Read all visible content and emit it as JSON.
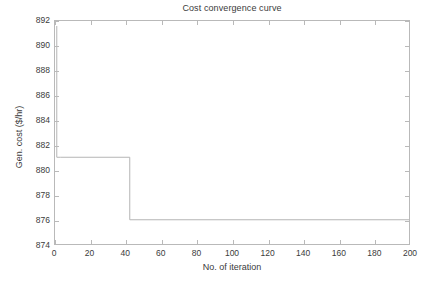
{
  "chart_data": {
    "type": "line",
    "title": "Cost convergence curve",
    "xlabel": "No. of iteration",
    "ylabel": "Gen. cost ($/hr)",
    "xlim": [
      0,
      200
    ],
    "ylim": [
      874,
      892
    ],
    "xticks": [
      0,
      20,
      40,
      60,
      80,
      100,
      120,
      140,
      160,
      180,
      200
    ],
    "yticks": [
      874,
      876,
      878,
      880,
      882,
      884,
      886,
      888,
      890,
      892
    ],
    "grid": false,
    "legend": null,
    "line_color": "#b5b5b5",
    "background_color": "#ffffff",
    "axis_color": "#b9b9b9",
    "series": [
      {
        "name": "Gen. cost",
        "x": [
          1,
          1,
          3,
          3,
          42,
          42,
          200
        ],
        "y": [
          891.6,
          881.1,
          881.1,
          881.1,
          881.1,
          876.1,
          876.1
        ],
        "step_points": [
          {
            "iteration": 1,
            "cost": 891.6
          },
          {
            "iteration": 3,
            "cost": 881.1
          },
          {
            "iteration": 42,
            "cost": 881.1
          },
          {
            "iteration": 43,
            "cost": 876.1
          },
          {
            "iteration": 200,
            "cost": 876.1
          }
        ],
        "initial_cost": 891.6,
        "final_cost": 876.1
      }
    ]
  }
}
